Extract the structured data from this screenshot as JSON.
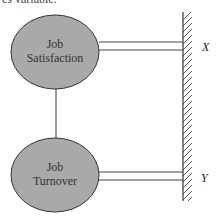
{
  "caption_fragment": "es variable.",
  "nodes": [
    {
      "id": "job-satisfaction",
      "line1": "Job",
      "line2": "Satisfaction",
      "cx": 55,
      "cy": 52
    },
    {
      "id": "job-turnover",
      "line1": "Job",
      "line2": "Turnover",
      "cx": 55,
      "cy": 175
    }
  ],
  "labels": {
    "x": "X",
    "y": "Y"
  },
  "colors": {
    "node_fill": "#a9a9a9",
    "stroke": "#333333",
    "background": "#ffffff"
  }
}
